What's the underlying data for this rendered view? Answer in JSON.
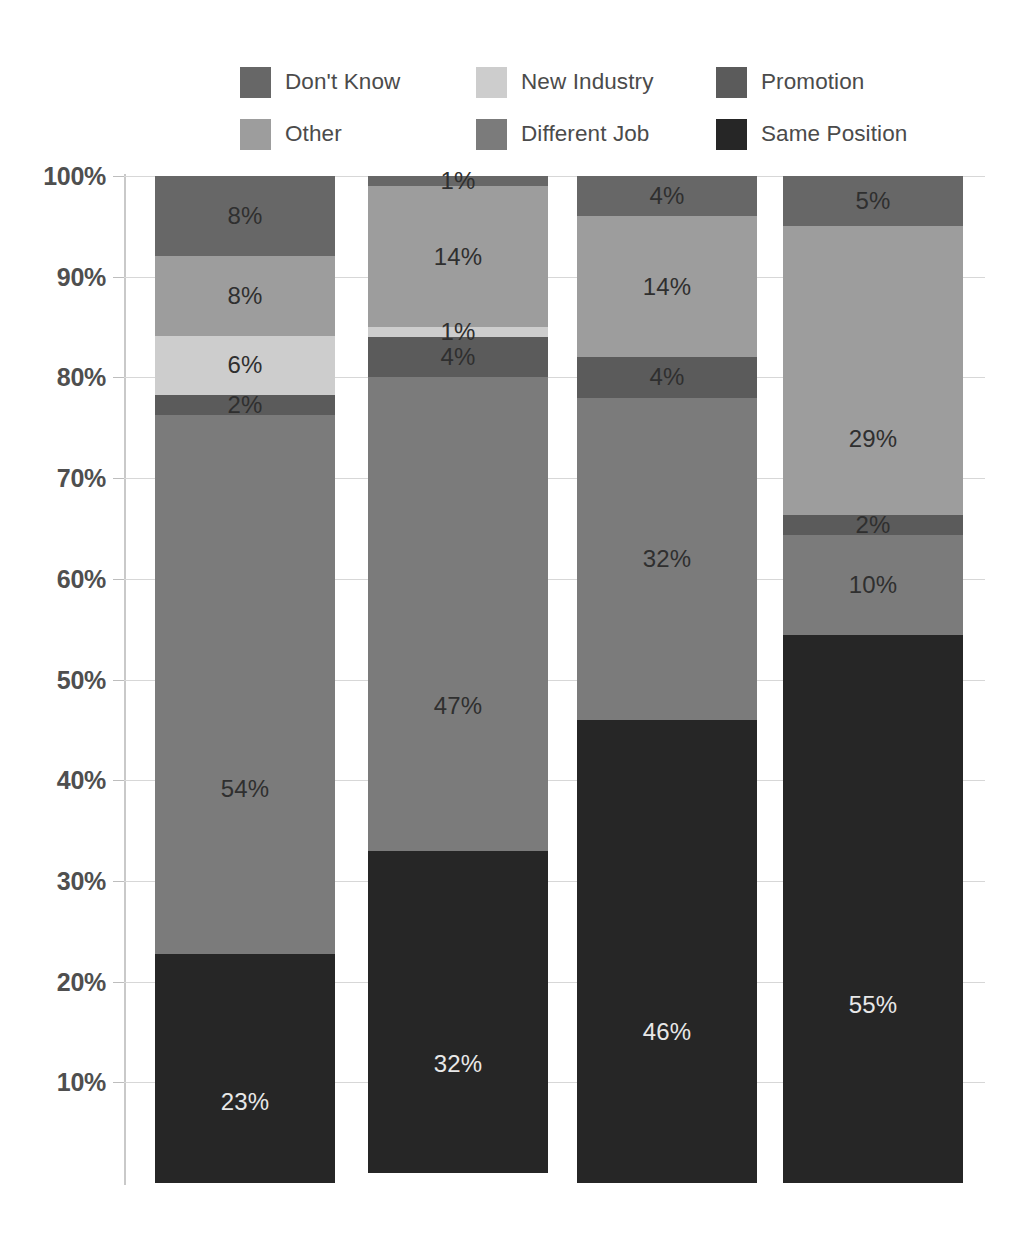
{
  "legend": {
    "items": [
      {
        "label": "Don't Know",
        "color": "#676767",
        "key": "dont_know"
      },
      {
        "label": "New Industry",
        "color": "#cdcdcd",
        "key": "new_industry"
      },
      {
        "label": "Promotion",
        "color": "#5b5b5b",
        "key": "promotion"
      },
      {
        "label": "Other",
        "color": "#9d9d9d",
        "key": "other"
      },
      {
        "label": "Different Job",
        "color": "#7b7b7b",
        "key": "different_job"
      },
      {
        "label": "Same Position",
        "color": "#262626",
        "key": "same_position"
      }
    ]
  },
  "axis": {
    "y_ticks": [
      "100%",
      "90%",
      "80%",
      "70%",
      "60%",
      "50%",
      "40%",
      "30%",
      "20%",
      "10%"
    ],
    "y_values": [
      100,
      90,
      80,
      70,
      60,
      50,
      40,
      30,
      20,
      10
    ]
  },
  "chart_data": {
    "type": "bar",
    "subtype": "stacked-percentage",
    "title": "",
    "xlabel": "",
    "ylabel": "",
    "ylim": [
      0,
      100
    ],
    "grid": true,
    "legend_position": "top",
    "categories": [
      "Group 1",
      "Group 2",
      "Group 3",
      "Group 4"
    ],
    "stack_order_bottom_to_top": [
      "Same Position",
      "Different Job",
      "Promotion",
      "New Industry",
      "Other",
      "Don't Know"
    ],
    "series": [
      {
        "name": "Same Position",
        "color": "#262626",
        "values": [
          23,
          32,
          46,
          55
        ]
      },
      {
        "name": "Different Job",
        "color": "#7b7b7b",
        "values": [
          54,
          47,
          32,
          10
        ]
      },
      {
        "name": "Promotion",
        "color": "#5b5b5b",
        "values": [
          2,
          4,
          4,
          2
        ]
      },
      {
        "name": "New Industry",
        "color": "#cdcdcd",
        "values": [
          6,
          1,
          0,
          0
        ]
      },
      {
        "name": "Other",
        "color": "#9d9d9d",
        "values": [
          8,
          14,
          14,
          29
        ]
      },
      {
        "name": "Don't Know",
        "color": "#676767",
        "values": [
          8,
          1,
          4,
          5
        ]
      }
    ],
    "bar_labels": [
      [
        {
          "series": "Don't Know",
          "text": "8%",
          "value": 8,
          "label_color": "dark"
        },
        {
          "series": "Other",
          "text": "8%",
          "value": 8,
          "label_color": "dark"
        },
        {
          "series": "New Industry",
          "text": "6%",
          "value": 6,
          "label_color": "dark"
        },
        {
          "series": "Promotion",
          "text": "2%",
          "value": 2,
          "label_color": "dark"
        },
        {
          "series": "Different Job",
          "text": "54%",
          "value": 54,
          "label_color": "dark"
        },
        {
          "series": "Same Position",
          "text": "23%",
          "value": 23,
          "label_color": "light"
        }
      ],
      [
        {
          "series": "Don't Know",
          "text": "1%",
          "value": 1,
          "label_color": "dark"
        },
        {
          "series": "Other",
          "text": "14%",
          "value": 14,
          "label_color": "dark"
        },
        {
          "series": "New Industry",
          "text": "1%",
          "value": 1,
          "label_color": "dark"
        },
        {
          "series": "Promotion",
          "text": "4%",
          "value": 4,
          "label_color": "dark"
        },
        {
          "series": "Different Job",
          "text": "47%",
          "value": 47,
          "label_color": "dark"
        },
        {
          "series": "Same Position",
          "text": "32%",
          "value": 32,
          "label_color": "light"
        }
      ],
      [
        {
          "series": "Don't Know",
          "text": "4%",
          "value": 4,
          "label_color": "dark"
        },
        {
          "series": "Other",
          "text": "14%",
          "value": 14,
          "label_color": "dark"
        },
        {
          "series": "New Industry",
          "text": "",
          "value": 0,
          "label_color": "dark"
        },
        {
          "series": "Promotion",
          "text": "4%",
          "value": 4,
          "label_color": "dark"
        },
        {
          "series": "Different Job",
          "text": "32%",
          "value": 32,
          "label_color": "dark"
        },
        {
          "series": "Same Position",
          "text": "46%",
          "value": 46,
          "label_color": "light"
        }
      ],
      [
        {
          "series": "Don't Know",
          "text": "5%",
          "value": 5,
          "label_color": "dark"
        },
        {
          "series": "Other",
          "text": "29%",
          "value": 29,
          "label_color": "dark"
        },
        {
          "series": "New Industry",
          "text": "",
          "value": 0,
          "label_color": "dark"
        },
        {
          "series": "Promotion",
          "text": "2%",
          "value": 2,
          "label_color": "dark"
        },
        {
          "series": "Different Job",
          "text": "10%",
          "value": 10,
          "label_color": "dark"
        },
        {
          "series": "Same Position",
          "text": "55%",
          "value": 55,
          "label_color": "light"
        }
      ]
    ]
  },
  "geometry": {
    "plot_top_px": 176,
    "plot_bottom_px": 1183,
    "axis_x_px": 124,
    "bar_width_px": 180,
    "bar_left_px": [
      155,
      368,
      577,
      783
    ]
  }
}
